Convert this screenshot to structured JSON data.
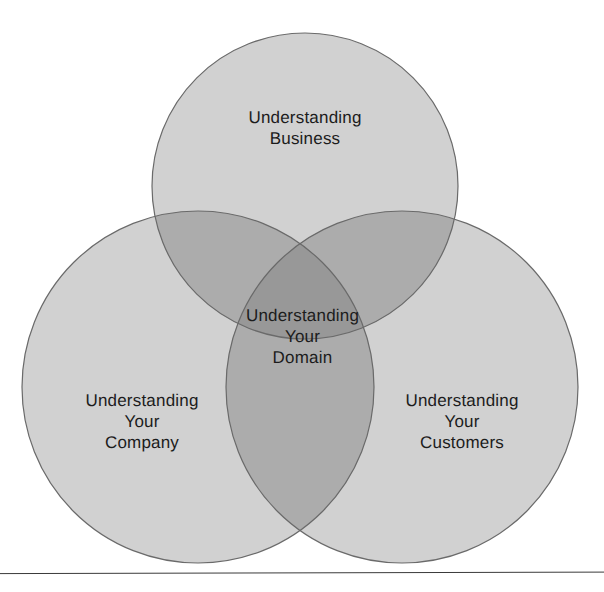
{
  "figure": {
    "type": "venn-diagram",
    "set_count": 3,
    "background_color": "#ffffff",
    "circle_fill_color": "#b4b4b4",
    "circle_fill_opacity": 0.62,
    "circle_stroke_color": "#6a6a6a",
    "circle_stroke_width": 1.2,
    "text_color": "#1c1c1c",
    "overlap_pair_color": "#9a9a9a",
    "overlap_triple_color": "#909090"
  },
  "circles": [
    {
      "id": "business",
      "name": "top-circle",
      "label": "Understanding\nBusiness",
      "cx": 305,
      "cy": 186,
      "r": 153
    },
    {
      "id": "company",
      "name": "left-circle",
      "label": "Understanding\nYour\nCompany",
      "cx": 198,
      "cy": 387,
      "r": 176
    },
    {
      "id": "customers",
      "name": "right-circle",
      "label": "Understanding\nYour\nCustomers",
      "cx": 402,
      "cy": 387,
      "r": 176
    }
  ],
  "labels": {
    "business": "Understanding\nBusiness",
    "company": "Understanding\nYour\nCompany",
    "customers": "Understanding\nYour\nCustomers",
    "domain": "Understanding\nYour\nDomain"
  },
  "center_intersection": {
    "label": "Understanding\nYour\nDomain",
    "cx": 303,
    "cy": 347
  },
  "bottom_rule": {
    "color": "#3a3a3a",
    "thickness": 1
  }
}
